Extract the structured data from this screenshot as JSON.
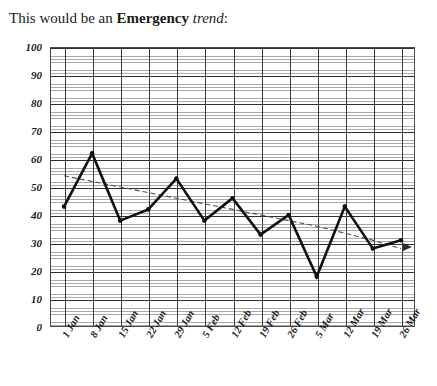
{
  "title": {
    "prefix": "This would be an ",
    "emphasis": "Emergency",
    "space": " ",
    "italic": "trend",
    "suffix": ":"
  },
  "chart_data": {
    "type": "line",
    "title": "This would be an Emergency trend:",
    "xlabel": "",
    "ylabel": "",
    "categories": [
      "1 Jan",
      "8 Jan",
      "15 Jan",
      "22 Jan",
      "29 Jan",
      "5 Feb",
      "12 Feb",
      "19 Feb",
      "26 Feb",
      "5 Mar",
      "12 Mar",
      "19 Mar",
      "26 Mar"
    ],
    "values": [
      43,
      62,
      38,
      42,
      53,
      38,
      46,
      33,
      40,
      18,
      43,
      28,
      31
    ],
    "series": [
      {
        "name": "Emergency data",
        "style": "solid-thick-black-with-markers",
        "values": [
          43,
          62,
          38,
          42,
          53,
          38,
          46,
          33,
          40,
          18,
          43,
          28,
          31
        ]
      },
      {
        "name": "Trend line",
        "style": "dashed-thin-with-arrowhead",
        "values": [
          54,
          52.0,
          50.0,
          48.0,
          46.0,
          44.0,
          42.0,
          40.0,
          38.0,
          36.0,
          33.5,
          31.0,
          28.0
        ]
      }
    ],
    "ylim": [
      0,
      100
    ],
    "yticks": [
      0,
      10,
      20,
      30,
      40,
      50,
      60,
      70,
      80,
      90,
      100
    ],
    "ytick_labels": [
      "0",
      "10",
      "20",
      "30",
      "40",
      "50",
      "60",
      "70",
      "80",
      "90",
      "100"
    ],
    "grid": true,
    "grid_minor": true,
    "legend": "none",
    "trend_direction": "decreasing",
    "annotations": [
      {
        "name": "trend-arrowhead",
        "shape": "right-pointing-triangle",
        "position": "end-of-trend-line"
      }
    ]
  },
  "colors": {
    "series_line": "#111111",
    "trend_line": "#4d4d4d",
    "grid_major": "#3d3d3d",
    "grid_minor": "#9a9a9a",
    "frame": "#4a4a4a",
    "background": "#ffffff",
    "text": "#1b1b1b"
  }
}
